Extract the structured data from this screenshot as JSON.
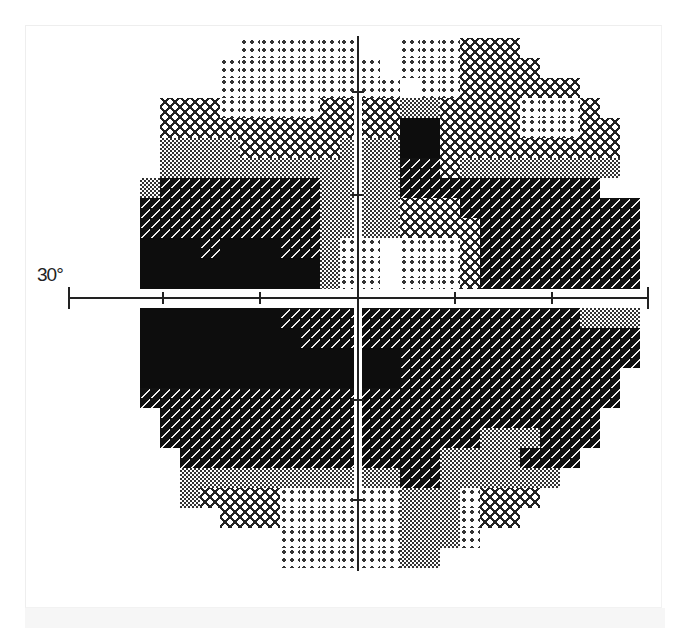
{
  "chart_data": {
    "type": "heatmap",
    "title": "",
    "axis_label_left": "30°",
    "xlim": [
      -30,
      30
    ],
    "ylim": [
      -30,
      30
    ],
    "ticks_x_deg": [
      -30,
      -20,
      -10,
      0,
      10,
      20,
      30
    ],
    "ticks_y_deg": [
      -20,
      -10,
      10,
      20
    ],
    "levels": {
      "0": "none",
      "1": "sparse dots (near normal)",
      "2": "crosshatch (mild loss)",
      "3": "checker (moderate loss)",
      "4": "dark with dashes (severe loss)",
      "5": "solid black (absolute loss)"
    },
    "grid": {
      "origin_x_px": 120,
      "cell_px": 20,
      "upper_origin_y_px": 38,
      "lower_origin_y_px": 308,
      "upper_rows": [
        "00000011111100111222000000",
        "00000111111110111222200000",
        "00000111111111011222222000",
        "00222111112222332222111200",
        "00222222222222552222111220",
        "00333322222333552222222220",
        "00333333333333442333333330",
        "03444444443333444444444400",
        "04444444443333222444444444",
        "04444444443333222244444444",
        "05554555443110111244444444",
        "05555555553110111244444444",
        "05555555553110111244444444"
      ],
      "lower_rows": [
        "05555555444444444444444333",
        "05555555544444444444444444",
        "05555555555555444444444444",
        "05555555555555444444444440",
        "04444444444444444444444440",
        "00444444444444444444444400",
        "00444444444444444433344400",
        "00044444444444443333444000",
        "00033333333333443333330000",
        "00032222111111333122200000",
        "00000222111111333122000000",
        "00000000111111333100000000",
        "00000000111111330000000000"
      ]
    }
  }
}
